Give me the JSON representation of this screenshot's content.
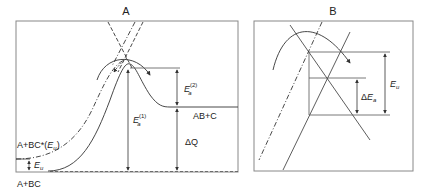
{
  "panel_a": {
    "title": "A",
    "labels": {
      "reactants": "A+BC",
      "excited_reactants": "A+BC*(",
      "excited_energy_symbol": "E",
      "excited_energy_sub": "u",
      "excited_close": ")",
      "products": "AB+C",
      "vib_energy_symbol": "E",
      "vib_energy_sub": "u",
      "activation_1_symbol": "E",
      "activation_1_sub": "a",
      "activation_1_sup": "(1)",
      "activation_2_symbol": "E",
      "activation_2_sub": "a",
      "activation_2_sup": "(2)",
      "heat_symbol": "ΔQ"
    }
  },
  "panel_b": {
    "title": "B",
    "labels": {
      "delta_ea_prefix": "Δ",
      "delta_ea_symbol": "E",
      "delta_ea_sub": "a",
      "eu_symbol": "E",
      "eu_sub": "u"
    }
  },
  "colors": {
    "line": "#333333",
    "border": "#777777",
    "text": "#222222"
  }
}
